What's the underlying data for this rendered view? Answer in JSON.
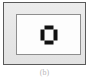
{
  "figure": {
    "caption": "(b)",
    "panel": {
      "background_color": "#e8e8e8",
      "border_color": "#5a5a5a"
    },
    "inner_rect": {
      "background_color": "#fdfdfd",
      "border_color": "#8e8e8e"
    },
    "glyph": {
      "name": "square-ring-marker",
      "color": "#111111",
      "description": "bold square outline formed by four bars with corner gaps",
      "bars": [
        {
          "side": "top"
        },
        {
          "side": "right"
        },
        {
          "side": "bottom"
        },
        {
          "side": "left"
        }
      ]
    }
  }
}
